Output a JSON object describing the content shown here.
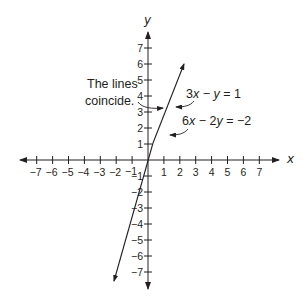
{
  "chart_data": {
    "type": "line",
    "title": "",
    "xlabel": "x",
    "ylabel": "y",
    "xlim": [
      -7,
      7
    ],
    "ylim": [
      -7,
      7
    ],
    "grid": false,
    "x_ticks": [
      -7,
      -6,
      -5,
      -4,
      -3,
      -2,
      -1,
      1,
      2,
      3,
      4,
      5,
      6,
      7
    ],
    "y_ticks": [
      -7,
      -6,
      -5,
      -4,
      -3,
      -2,
      -1,
      1,
      2,
      3,
      4,
      5,
      6,
      7
    ],
    "series": [
      {
        "name": "3x − y = 1",
        "equation": "y = 3x − 1",
        "x": [
          -2.2,
          2.3
        ],
        "y": [
          -7.6,
          6.0
        ]
      },
      {
        "name": "6x − 2y = −2",
        "equation": "coincident with 3x − y = 1 as drawn",
        "x": [
          -2.2,
          2.3
        ],
        "y": [
          -7.6,
          6.0
        ]
      }
    ],
    "annotations": [
      {
        "text": "The lines coincide.",
        "points_to": "line"
      },
      {
        "text": "3x − y = 1",
        "points_to": "line"
      },
      {
        "text": "6x − 2y = −2",
        "points_to": "line"
      }
    ]
  },
  "axes": {
    "x_name": "x",
    "y_name": "y",
    "x_tick_labels": [
      "−7",
      "−6",
      "−5",
      "−4",
      "−3",
      "−2",
      "−1",
      "1",
      "2",
      "3",
      "4",
      "5",
      "6",
      "7"
    ],
    "y_tick_labels_pos": [
      "1",
      "2",
      "3",
      "4",
      "5",
      "6",
      "7"
    ],
    "y_tick_labels_neg": [
      "−1",
      "−2",
      "−3",
      "−4",
      "−5",
      "−6",
      "−7"
    ]
  },
  "annotations": {
    "coincide_line1": "The lines",
    "coincide_line2": "coincide.",
    "eq1": {
      "a": "3",
      "v1": "x",
      "op": " − ",
      "v2": "y",
      "rhs": " = 1"
    },
    "eq2": {
      "a": "6",
      "v1": "x",
      "op": " − 2",
      "v2": "y",
      "rhs": " = −2"
    }
  }
}
